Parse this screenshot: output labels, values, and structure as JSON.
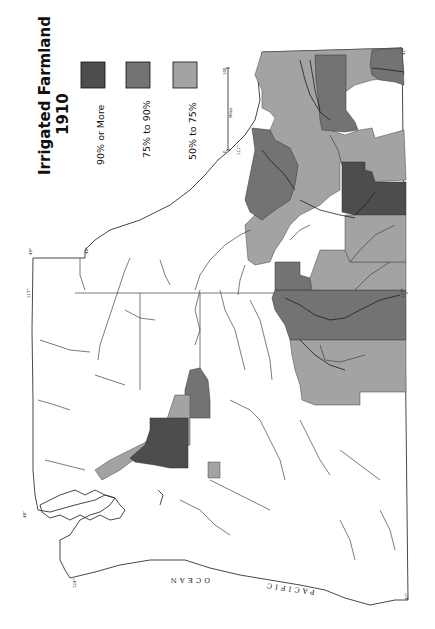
{
  "map": {
    "title_line1": "Irrigated   Farmland",
    "title_line2": "1910",
    "orientation": "rotated 90° counter-clockwise",
    "colors": {
      "c90": "#4d4d4d",
      "c75": "#737373",
      "c50": "#a3a3a3",
      "land": "#ffffff",
      "line": "#333333"
    },
    "legend": {
      "items": [
        {
          "label": "90% or More",
          "color": "#4d4d4d"
        },
        {
          "label": "75% to 90%",
          "color": "#737373"
        },
        {
          "label": "50% to 75%",
          "color": "#a3a3a3"
        }
      ]
    },
    "scale_bar": {
      "start": "0",
      "end": "100",
      "unit": "Miles"
    },
    "labels": {
      "ocean_part1": "PACIFIC",
      "ocean_part2": "OCEAN"
    },
    "graticule": {
      "lat_49": "49°",
      "lat_48": "48°",
      "lat_47": "47°",
      "lat_42": "42°",
      "lon_120": "120°",
      "lon_117": "117°",
      "lon_111": "111°",
      "lon_124": "124°"
    }
  }
}
